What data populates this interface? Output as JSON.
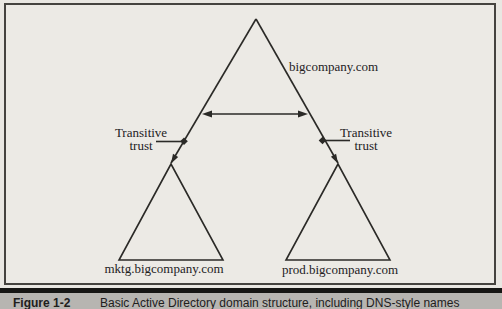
{
  "figure": {
    "diagram": {
      "root_domain": "bigcompany.com",
      "left_child_domain": "mktg.bigcompany.com",
      "right_child_domain": "prod.bigcompany.com",
      "left_trust": {
        "line1": "Transitive",
        "line2": "trust"
      },
      "right_trust": {
        "line1": "Transitive",
        "line2": "trust"
      }
    },
    "caption": {
      "label": "Figure 1-2",
      "text": "Basic Active Directory domain structure, including DNS-style names"
    },
    "colors": {
      "paper": "#e9e7e2",
      "diagram_line": "#2b2a27",
      "caption_bar_background": "#b7b5b1",
      "caption_rule": "#161614",
      "text": "#23211e"
    }
  }
}
